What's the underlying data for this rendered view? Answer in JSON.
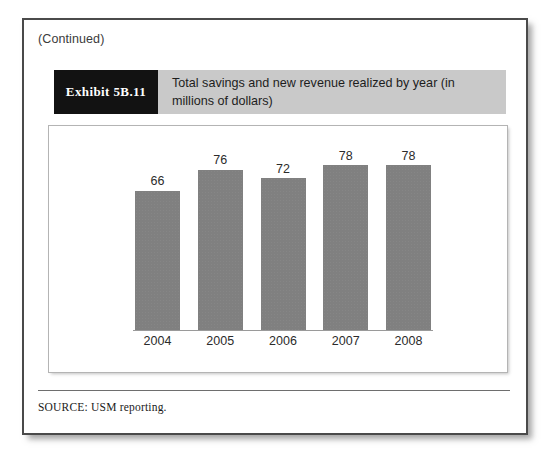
{
  "page": {
    "continued_label": "(Continued)"
  },
  "exhibit": {
    "tag": "Exhibit 5B.11",
    "title": "Total savings and new revenue realized by year (in millions of dollars)"
  },
  "footer": {
    "source": "SOURCE: USM reporting."
  },
  "colors": {
    "bar_fill": "#808080",
    "band_tag_bg": "#121212",
    "band_title_bg": "#c9c9c9",
    "page_border": "#4a4a4a",
    "axis_line": "#9a9a9a"
  },
  "chart_data": {
    "type": "bar",
    "title": "Total savings and new revenue realized by year (in millions of dollars)",
    "xlabel": "",
    "ylabel": "",
    "categories": [
      "2004",
      "2005",
      "2006",
      "2007",
      "2008"
    ],
    "values": [
      66,
      76,
      72,
      78,
      78
    ],
    "data_labels": [
      "66",
      "76",
      "72",
      "78",
      "78"
    ],
    "ylim": [
      0,
      90
    ],
    "grid": false,
    "legend": "none",
    "units": "millions of dollars"
  }
}
